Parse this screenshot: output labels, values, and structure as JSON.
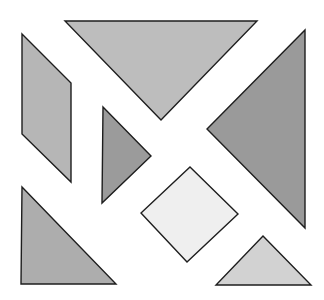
{
  "diagram": {
    "type": "tangram",
    "background": "#ffffff",
    "stroke_color": "#1e1e1e",
    "pieces": [
      {
        "id": "large-triangle-top",
        "shape": "triangle",
        "fill": "#bdbdbd",
        "points": "65,21 257,21 161,120"
      },
      {
        "id": "large-triangle-right",
        "shape": "triangle",
        "fill": "#9a9a9a",
        "points": "305,30 305,228 207,129"
      },
      {
        "id": "parallelogram-left",
        "shape": "parallelogram",
        "fill": "#b6b6b6",
        "points": "22,34 71,83 71,182 22,134"
      },
      {
        "id": "small-triangle-center-left",
        "shape": "triangle",
        "fill": "#9b9b9b",
        "points": "103,107 151,156 102,203"
      },
      {
        "id": "square-center",
        "shape": "square",
        "fill": "#efefef",
        "points": "190,167 238,214 187,262 141,213"
      },
      {
        "id": "medium-triangle-bottom-left",
        "shape": "triangle",
        "fill": "#adadad",
        "points": "22,187 116,284 21,284"
      },
      {
        "id": "small-triangle-bottom-right",
        "shape": "triangle",
        "fill": "#d2d2d2",
        "points": "263,236 311,285 216,285"
      }
    ]
  }
}
